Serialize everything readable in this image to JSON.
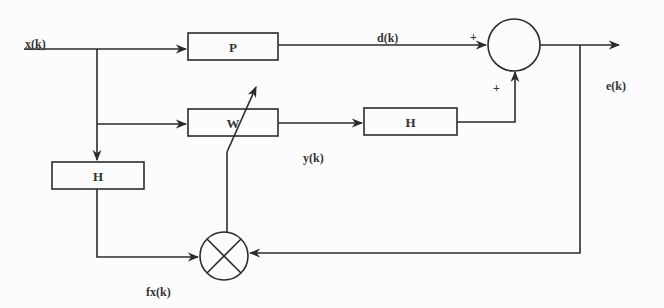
{
  "diagram": {
    "type": "block-diagram",
    "signals": {
      "input": "x(k)",
      "desired": "d(k)",
      "filter_output": "y(k)",
      "error": "e(k)",
      "filtered_input": "fx(k)"
    },
    "blocks": {
      "plant": "P",
      "adaptive_filter": "W",
      "secondary_path": "H",
      "secondary_path_estimate": "H"
    },
    "summing_junction": {
      "sign_top": "+",
      "sign_bottom": "+"
    },
    "colors": {
      "line": "#2b2b2b",
      "background": "#fcfcfc"
    }
  }
}
